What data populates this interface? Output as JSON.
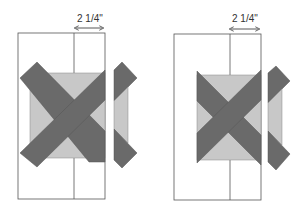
{
  "figures": [
    {
      "id": "left",
      "measurement_label": "2 1/4\""
    },
    {
      "id": "right",
      "measurement_label": "2 1/4\""
    }
  ],
  "colors": {
    "outline": "#555555",
    "light_fill": "#c8c8c8",
    "dark_fill": "#6a6a6a",
    "background": "#ffffff"
  }
}
